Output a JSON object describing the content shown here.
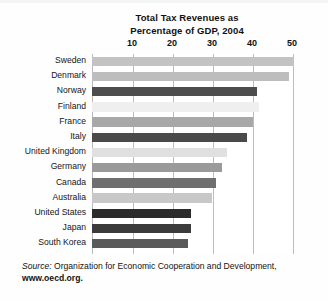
{
  "figure": {
    "title_lines": [
      "Total Tax Revenues as",
      "Percentage of GDP, 2004"
    ],
    "source_prefix": "Source:",
    "source_text": " Organization for Economic Cooperation and Development,",
    "source_url": "www.oecd.org."
  },
  "chart_data": {
    "type": "bar",
    "orientation": "horizontal",
    "title": "Total Tax Revenues as Percentage of GDP, 2004",
    "xlabel": "",
    "ylabel": "",
    "xlim": [
      0,
      52
    ],
    "xticks": [
      10,
      20,
      30,
      40,
      50
    ],
    "xtick_labels": [
      "10",
      "20",
      "30",
      "40",
      "50"
    ],
    "grid": true,
    "legend": "none",
    "categories": [
      "Sweden",
      "Denmark",
      "Norway",
      "Finland",
      "France",
      "Italy",
      "United Kingdom",
      "Germany",
      "Canada",
      "Australia",
      "United States",
      "Japan",
      "South Korea"
    ],
    "values": [
      50.6,
      49.3,
      41.3,
      41.8,
      40.3,
      38.7,
      33.8,
      32.5,
      31.0,
      30.0,
      24.8,
      24.7,
      24.0
    ],
    "bar_colors": [
      "#c3c3c3",
      "#bdbdbd",
      "#4d4d4d",
      "#efefef",
      "#a8a8a8",
      "#4a4a4a",
      "#e0e0e0",
      "#9a9a9a",
      "#6f6f6f",
      "#c8c8c8",
      "#2b2b2b",
      "#3b3b3b",
      "#5a5a5a"
    ]
  }
}
